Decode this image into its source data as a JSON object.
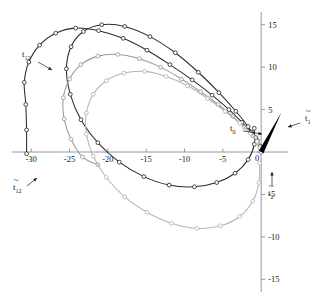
{
  "chart_data": {
    "type": "line",
    "title": "",
    "xlabel": "",
    "ylabel": "",
    "xlim": [
      -32.5,
      3.5
    ],
    "ylim": [
      -16.5,
      16.5
    ],
    "grid": false,
    "legend_position": "none",
    "x_ticks": [
      "-30",
      "-25",
      "-20",
      "-15",
      "-10",
      "-5",
      "0"
    ],
    "x_tick_values": [
      -30,
      -25,
      -20,
      -15,
      -10,
      -5,
      0
    ],
    "y_ticks": [
      "15",
      "10",
      "5",
      "0",
      "-5",
      "-10",
      "-15"
    ],
    "y_tick_values": [
      15,
      10,
      5,
      0,
      -5,
      -10,
      -15
    ],
    "marker": "circle",
    "series": [
      {
        "name": "spiral-dark-outer",
        "color": "#2b2b2b",
        "points": [
          [
            0.0,
            0.0
          ],
          [
            -0.12,
            0.55
          ],
          [
            -0.5,
            1.35
          ],
          [
            -1.25,
            2.3
          ],
          [
            -2.5,
            3.5
          ],
          [
            -4.2,
            5.0
          ],
          [
            -6.4,
            6.7
          ],
          [
            -9.0,
            8.5
          ],
          [
            -11.9,
            10.3
          ],
          [
            -14.9,
            12.0
          ],
          [
            -18.0,
            13.4
          ],
          [
            -21.2,
            14.3
          ],
          [
            -24.2,
            14.6
          ],
          [
            -26.8,
            14.0
          ],
          [
            -28.9,
            12.6
          ],
          [
            -30.3,
            10.6
          ],
          [
            -30.9,
            8.2
          ],
          [
            -30.7,
            5.6
          ],
          [
            -30.6,
            2.6
          ],
          [
            -30.6,
            -0.2
          ]
        ]
      },
      {
        "name": "spiral-dark-inner",
        "color": "#2b2b2b",
        "points": [
          [
            0.0,
            0.0
          ],
          [
            -0.15,
            0.7
          ],
          [
            -0.7,
            1.7
          ],
          [
            -1.7,
            3.0
          ],
          [
            -3.3,
            4.8
          ],
          [
            -5.5,
            7.0
          ],
          [
            -8.2,
            9.4
          ],
          [
            -11.2,
            11.7
          ],
          [
            -14.5,
            13.6
          ],
          [
            -17.8,
            14.8
          ],
          [
            -20.8,
            15.0
          ],
          [
            -23.2,
            14.2
          ],
          [
            -24.8,
            12.4
          ],
          [
            -25.4,
            9.8
          ],
          [
            -24.9,
            6.8
          ],
          [
            -23.5,
            3.8
          ],
          [
            -21.3,
            1.1
          ],
          [
            -18.5,
            -1.2
          ],
          [
            -15.3,
            -2.9
          ],
          [
            -12.0,
            -3.9
          ],
          [
            -8.7,
            -4.1
          ],
          [
            -5.8,
            -3.6
          ],
          [
            -3.4,
            -2.5
          ],
          [
            -1.7,
            -0.9
          ],
          [
            -0.9,
            0.9
          ],
          [
            -0.9,
            2.8
          ]
        ]
      },
      {
        "name": "spiral-gray-outer",
        "color": "#9a9a9a",
        "points": [
          [
            0.0,
            0.0
          ],
          [
            -0.1,
            0.45
          ],
          [
            -0.45,
            1.1
          ],
          [
            -1.1,
            1.9
          ],
          [
            -2.2,
            2.9
          ],
          [
            -3.7,
            4.2
          ],
          [
            -5.6,
            5.6
          ],
          [
            -7.9,
            7.1
          ],
          [
            -10.4,
            8.6
          ],
          [
            -13.1,
            10.0
          ],
          [
            -15.9,
            11.0
          ],
          [
            -18.7,
            11.5
          ],
          [
            -21.3,
            11.3
          ],
          [
            -23.5,
            10.3
          ],
          [
            -25.0,
            8.6
          ],
          [
            -25.8,
            6.4
          ],
          [
            -25.7,
            3.9
          ],
          [
            -24.8,
            1.5
          ],
          [
            -23.3,
            -0.6
          ],
          [
            -21.3,
            -1.5
          ]
        ]
      },
      {
        "name": "spiral-gray-inner",
        "color": "#b5b5b5",
        "points": [
          [
            0.0,
            0.0
          ],
          [
            -0.12,
            0.5
          ],
          [
            -0.55,
            1.25
          ],
          [
            -1.4,
            2.2
          ],
          [
            -2.8,
            3.4
          ],
          [
            -4.7,
            4.8
          ],
          [
            -7.0,
            6.3
          ],
          [
            -9.6,
            7.8
          ],
          [
            -12.4,
            8.9
          ],
          [
            -15.2,
            9.5
          ],
          [
            -17.9,
            9.3
          ],
          [
            -20.2,
            8.4
          ],
          [
            -21.9,
            6.8
          ],
          [
            -22.8,
            4.6
          ],
          [
            -22.8,
            2.1
          ],
          [
            -21.9,
            -0.5
          ],
          [
            -20.2,
            -3.0
          ],
          [
            -17.8,
            -5.3
          ],
          [
            -14.9,
            -7.1
          ],
          [
            -11.7,
            -8.4
          ],
          [
            -8.4,
            -9.0
          ],
          [
            -5.3,
            -8.7
          ],
          [
            -2.8,
            -7.6
          ],
          [
            -1.1,
            -5.8
          ],
          [
            -0.3,
            -3.6
          ],
          [
            -0.2,
            -1.3
          ]
        ]
      }
    ],
    "annotations": [
      {
        "name": "t12-upper-label",
        "text": "t",
        "sub": "12",
        "accent": false,
        "x": 22,
        "y": 57,
        "arrow_from": [
          38,
          62
        ],
        "arrow_to": [
          52,
          70
        ]
      },
      {
        "name": "t12-lower-label",
        "text": "t",
        "sub": "12",
        "accent": true,
        "x": 13,
        "y": 190,
        "arrow_from": [
          27,
          186
        ],
        "arrow_to": [
          37,
          178
        ]
      },
      {
        "name": "t0-label",
        "text": "t",
        "sub": "0",
        "accent": false,
        "x": 230,
        "y": 131,
        "arrow_from": [
          243,
          131
        ],
        "arrow_to": [
          262,
          134
        ]
      },
      {
        "name": "t1-tilde-label",
        "text": "t",
        "sub": "1",
        "accent": true,
        "x": 305,
        "y": 121,
        "arrow_from": [
          300,
          123
        ],
        "arrow_to": [
          288,
          127
        ]
      },
      {
        "name": "t2-tilde-label",
        "text": "t",
        "sub": "2",
        "accent": true,
        "x": 268,
        "y": 196,
        "arrow_from": [
          272,
          186
        ],
        "arrow_to": [
          272,
          172
        ]
      }
    ],
    "vectors": [
      {
        "name": "t1-tilde-vector",
        "color": "#000000",
        "from": [
          0.0,
          0.0
        ],
        "to": [
          2.6,
          4.6
        ]
      }
    ]
  }
}
